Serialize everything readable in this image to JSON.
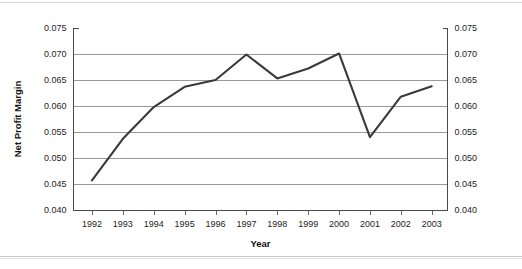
{
  "chart_data": {
    "type": "line",
    "title": "",
    "subtitle": "",
    "xlabel": "Year",
    "ylabel": "Net Profit Margin",
    "categories": [
      "1992",
      "1993",
      "1994",
      "1995",
      "1996",
      "1997",
      "1998",
      "1999",
      "2000",
      "2001",
      "2002",
      "2003"
    ],
    "values": [
      0.0457,
      0.0537,
      0.0598,
      0.0637,
      0.065,
      0.0699,
      0.0653,
      0.0672,
      0.0701,
      0.054,
      0.0618,
      0.0638
    ],
    "series": [
      {
        "name": "Net Profit Margin",
        "values": [
          0.0457,
          0.0537,
          0.0598,
          0.0637,
          0.065,
          0.0699,
          0.0653,
          0.0672,
          0.0701,
          0.054,
          0.0618,
          0.0638
        ]
      }
    ],
    "ylim": [
      0.04,
      0.075
    ],
    "ytick_step": 0.005,
    "ytick_labels_left": [
      "0.075",
      "0.070",
      "0.065",
      "0.060",
      "0.055",
      "0.050",
      "0.045",
      "0.040"
    ],
    "ytick_labels_right": [
      "0.075",
      "0.070",
      "0.065",
      "0.060",
      "0.055",
      "0.050",
      "0.045",
      "0.040"
    ],
    "ytick_values": [
      0.075,
      0.07,
      0.065,
      0.06,
      0.055,
      0.05,
      0.045,
      0.04
    ],
    "xtick_labels": [
      "1992",
      "1993",
      "1994",
      "1995",
      "1996",
      "1997",
      "1998",
      "1999",
      "2000",
      "2001",
      "2002",
      "2003"
    ],
    "grid": "horizontal",
    "legend": "none",
    "annotations": [],
    "colors": {
      "line": "#3a3a3a",
      "gridline": "#9a9a9a",
      "axis": "#4a4a4a",
      "text": "#1d1d1d",
      "background": "#ffffff"
    }
  }
}
